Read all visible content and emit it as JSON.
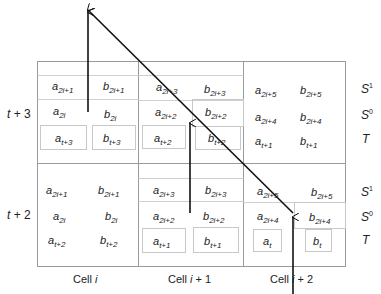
{
  "diagram": {
    "rows": [
      {
        "label_main": "t",
        "label_rest": " + 3"
      },
      {
        "label_main": "t",
        "label_rest": " + 2"
      }
    ],
    "columns": [
      {
        "label": "Cell ",
        "index": "i",
        "suffix": ""
      },
      {
        "label": "Cell ",
        "index": "i",
        "suffix": " + 1"
      },
      {
        "label": "Cell ",
        "index": "i",
        "suffix": " + 2"
      }
    ],
    "legend": {
      "s1": {
        "base": "S",
        "sup": "1"
      },
      "s0": {
        "base": "S",
        "sup": "0"
      },
      "t": {
        "base": "T"
      }
    },
    "cells": {
      "r0c0": {
        "s1a": {
          "base": "a",
          "sub": "2i+1"
        },
        "s1b": {
          "base": "b",
          "sub": "2i+1"
        },
        "s0a": {
          "base": "a",
          "sub": "2i"
        },
        "s0b": {
          "base": "b",
          "sub": "2i"
        },
        "ta": {
          "base": "a",
          "sub": "t+3"
        },
        "tb": {
          "base": "b",
          "sub": "t+3"
        }
      },
      "r0c1": {
        "s1a": {
          "base": "a",
          "sub": "2i+3"
        },
        "s1b": {
          "base": "b",
          "sub": "2i+3"
        },
        "s0a": {
          "base": "a",
          "sub": "2i+2"
        },
        "s0b": {
          "base": "b",
          "sub": "2i+2"
        },
        "ta": {
          "base": "a",
          "sub": "t+2"
        },
        "tb": {
          "base": "b",
          "sub": "t+2"
        }
      },
      "r0c2": {
        "s1a": {
          "base": "a",
          "sub": "2i+5"
        },
        "s1b": {
          "base": "b",
          "sub": "2i+5"
        },
        "s0a": {
          "base": "a",
          "sub": "2i+4"
        },
        "s0b": {
          "base": "b",
          "sub": "2i+4"
        },
        "ta": {
          "base": "a",
          "sub": "t+1"
        },
        "tb": {
          "base": "b",
          "sub": "t+1"
        }
      },
      "r1c0": {
        "s1a": {
          "base": "a",
          "sub": "2i+1"
        },
        "s1b": {
          "base": "b",
          "sub": "2i+1"
        },
        "s0a": {
          "base": "a",
          "sub": "2i"
        },
        "s0b": {
          "base": "b",
          "sub": "2i"
        },
        "ta": {
          "base": "a",
          "sub": "t+2"
        },
        "tb": {
          "base": "b",
          "sub": "t+2"
        }
      },
      "r1c1": {
        "s1a": {
          "base": "a",
          "sub": "2i+3"
        },
        "s1b": {
          "base": "b",
          "sub": "2i+3"
        },
        "s0a": {
          "base": "a",
          "sub": "2i+2"
        },
        "s0b": {
          "base": "b",
          "sub": "2i+2"
        },
        "ta": {
          "base": "a",
          "sub": "t+1"
        },
        "tb": {
          "base": "b",
          "sub": "t+1"
        }
      },
      "r1c2": {
        "s1a": {
          "base": "a",
          "sub": "2i+5"
        },
        "s1b": {
          "base": "b",
          "sub": "2i+5"
        },
        "s0a": {
          "base": "a",
          "sub": "2i+4"
        },
        "s0b": {
          "base": "b",
          "sub": "2i+4"
        },
        "ta": {
          "base": "a",
          "sub": "t"
        },
        "tb": {
          "base": "b",
          "sub": "t"
        }
      }
    },
    "colors": {
      "grid": "#9a9a9a",
      "inner_box": "#c8c8c8",
      "arrow": "#111111",
      "text": "#222222"
    }
  }
}
